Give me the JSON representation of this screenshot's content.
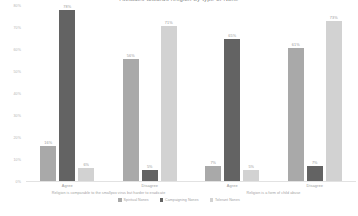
{
  "chart_data": {
    "type": "bar",
    "title": "Attitudes towards religion by type of None",
    "xlabel": "",
    "ylabel": "",
    "ylim": [
      0,
      80
    ],
    "grid": false,
    "legend_position": "bottom",
    "yticks": [
      "80%",
      "70%",
      "60%",
      "50%",
      "40%",
      "30%",
      "20%",
      "10%",
      "0%"
    ],
    "ytick_values": [
      80,
      70,
      60,
      50,
      40,
      30,
      20,
      10,
      0
    ],
    "panels": [
      {
        "caption": "Religion is comparable to the smallpox virus but harder to eradicate",
        "categories": [
          "Agree",
          "Disagree"
        ],
        "series": [
          {
            "name": "Spiritual Nones",
            "color": "#a9a9a9",
            "values": [
              16,
              56
            ],
            "labels": [
              "16%",
              "56%"
            ]
          },
          {
            "name": "Campaigning Nones",
            "color": "#636363",
            "values": [
              78,
              5
            ],
            "labels": [
              "78%",
              "5%"
            ]
          },
          {
            "name": "Tolerant Nones",
            "color": "#d2d2d2",
            "values": [
              6,
              71
            ],
            "labels": [
              "6%",
              "71%"
            ]
          }
        ]
      },
      {
        "caption": "Religion is a form of child abuse",
        "categories": [
          "Agree",
          "Disagree"
        ],
        "series": [
          {
            "name": "Spiritual Nones",
            "color": "#a9a9a9",
            "values": [
              7,
              61
            ],
            "labels": [
              "7%",
              "61%"
            ]
          },
          {
            "name": "Campaigning Nones",
            "color": "#636363",
            "values": [
              65,
              7
            ],
            "labels": [
              "65%",
              "7%"
            ]
          },
          {
            "name": "Tolerant Nones",
            "color": "#d2d2d2",
            "values": [
              5,
              73
            ],
            "labels": [
              "5%",
              "73%"
            ]
          }
        ]
      }
    ],
    "legend": [
      {
        "label": "Spiritual Nones",
        "color": "#a9a9a9"
      },
      {
        "label": "Campaigning Nones",
        "color": "#636363"
      },
      {
        "label": "Tolerant Nones",
        "color": "#d2d2d2"
      }
    ]
  }
}
